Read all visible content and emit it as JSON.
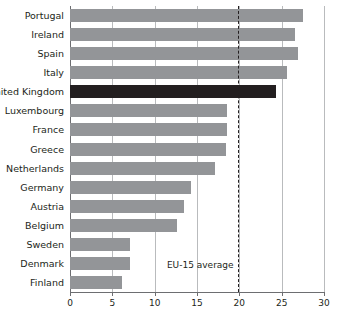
{
  "chart_data": {
    "type": "bar",
    "orientation": "horizontal",
    "title": "",
    "xlabel": "",
    "ylabel": "",
    "xlim": [
      0,
      30
    ],
    "xticks": [
      0,
      5,
      10,
      15,
      20,
      25,
      30
    ],
    "grid": "vertical",
    "legend": "none",
    "categories": [
      "Portugal",
      "Ireland",
      "Spain",
      "Italy",
      "United Kingdom",
      "Luxembourg",
      "France",
      "Greece",
      "Netherlands",
      "Germany",
      "Austria",
      "Belgium",
      "Sweden",
      "Denmark",
      "Finland"
    ],
    "values": [
      27.5,
      26.6,
      26.9,
      25.6,
      24.3,
      18.5,
      18.5,
      18.4,
      17.1,
      14.3,
      13.5,
      12.6,
      7.1,
      7.1,
      6.2
    ],
    "highlight_category": "United Kingdom",
    "annotations": [
      {
        "label": "EU-15 average",
        "value": 19.8,
        "style": "dashed-vertical-line"
      }
    ],
    "colors": {
      "bar": "#939598",
      "bar_highlight": "#231f20",
      "gridline": "#b9bbbd",
      "axis": "#6d6e71",
      "text": "#231f20",
      "background": "#ffffff"
    }
  }
}
